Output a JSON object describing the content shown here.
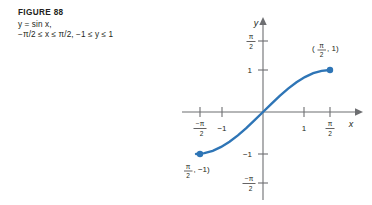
{
  "caption": {
    "title": "FIGURE 88",
    "line1": "y = sin x,",
    "line2": "−π/2 ≤ x ≤ π/2, −1 ≤ y ≤ 1"
  },
  "colors": {
    "curve": "#2E75B6",
    "point": "#2E75B6",
    "axis": "#6D6E71",
    "text": "#231F20",
    "background": "#FFFFFF"
  },
  "axes": {
    "x_label": "x",
    "y_label": "y",
    "x_ticks": [
      {
        "label_num": "−π",
        "label_den": "2",
        "kind": "fraction",
        "value": -1.5708
      },
      {
        "label": "−1",
        "kind": "plain",
        "value": -1
      },
      {
        "label": "1",
        "kind": "plain",
        "value": 1
      },
      {
        "label_num": "π",
        "label_den": "2",
        "kind": "fraction",
        "value": 1.5708
      }
    ],
    "y_ticks": [
      {
        "label_num": "π",
        "label_den": "2",
        "kind": "fraction",
        "value": 1.5708
      },
      {
        "label": "1",
        "kind": "plain",
        "value": 1
      },
      {
        "label": "−1",
        "kind": "plain",
        "value": -1
      },
      {
        "label_num": "−π",
        "label_den": "2",
        "kind": "fraction",
        "value": -1.5708
      }
    ]
  },
  "point_labels": {
    "upper_right": {
      "open": "(",
      "num": "π",
      "den": "2",
      "rest": ", 1)"
    },
    "lower_left": {
      "open": "(−",
      "num": "π",
      "den": "2",
      "rest": ", −1)"
    }
  },
  "endpoints": [
    {
      "name": "right-endpoint",
      "x": 1.5708,
      "y": 1
    },
    {
      "name": "left-endpoint",
      "x": -1.5708,
      "y": -1
    }
  ],
  "chart_data": {
    "type": "line",
    "title": "FIGURE 88",
    "subtitle": "y = sin x, −π/2 ≤ x ≤ π/2, −1 ≤ y ≤ 1",
    "xlabel": "x",
    "ylabel": "y",
    "xlim": [
      -2.0,
      2.1
    ],
    "ylim": [
      -1.9,
      1.9
    ],
    "grid": false,
    "legend": "none",
    "xticks": [
      -1.5708,
      -1,
      1,
      1.5708
    ],
    "xticklabels": [
      "−π/2",
      "−1",
      "1",
      "π/2"
    ],
    "yticks": [
      1.5708,
      1,
      -1,
      -1.5708
    ],
    "yticklabels": [
      "π/2",
      "1",
      "−1",
      "−π/2"
    ],
    "series": [
      {
        "name": "y = sin x",
        "color": "#2E75B6",
        "x": [
          -1.5708,
          -1.3744,
          -1.1781,
          -0.9817,
          -0.7854,
          -0.589,
          -0.3927,
          -0.1963,
          0,
          0.1963,
          0.3927,
          0.589,
          0.7854,
          0.9817,
          1.1781,
          1.3744,
          1.5708
        ],
        "y": [
          -1.0,
          -0.9808,
          -0.9239,
          -0.8315,
          -0.7071,
          -0.5556,
          -0.3827,
          -0.1951,
          0,
          0.1951,
          0.3827,
          0.5556,
          0.7071,
          0.8315,
          0.9239,
          0.9808,
          1.0
        ]
      }
    ],
    "annotations": [
      {
        "text": "(π/2, 1)",
        "x": 1.5708,
        "y": 1
      },
      {
        "text": "(−π/2, −1)",
        "x": -1.5708,
        "y": -1
      }
    ]
  }
}
